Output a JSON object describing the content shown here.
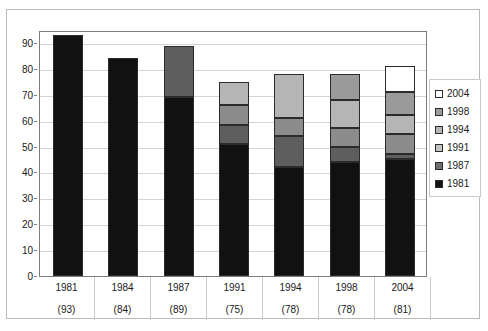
{
  "chart_data": {
    "type": "bar",
    "subtype": "stacked-bar",
    "title": "",
    "xlabel": "",
    "ylabel": "",
    "ylim": [
      0,
      95
    ],
    "y_ticks": [
      0,
      10,
      20,
      30,
      40,
      50,
      60,
      70,
      80,
      90
    ],
    "grid": true,
    "legend_position": "right",
    "categories": [
      "1981",
      "1984",
      "1987",
      "1991",
      "1994",
      "1998",
      "2004"
    ],
    "category_counts": [
      "(93)",
      "(84)",
      "(89)",
      "(75)",
      "(78)",
      "(78)",
      "(81)"
    ],
    "series": [
      {
        "name": "1981",
        "color": "#111111",
        "values": [
          93,
          84,
          69,
          51,
          42,
          44,
          45
        ]
      },
      {
        "name": "1987",
        "color": "#5e5e5e",
        "values": [
          0,
          0,
          20,
          7.5,
          12,
          6,
          2
        ]
      },
      {
        "name": "1991",
        "color": "#8c8c8c",
        "values": [
          0,
          0,
          0,
          7.5,
          7,
          7,
          8
        ]
      },
      {
        "name": "1994",
        "color": "#b5b5b5",
        "values": [
          0,
          0,
          0,
          9,
          17,
          11,
          7
        ]
      },
      {
        "name": "1998",
        "color": "#9a9a9a",
        "values": [
          0,
          0,
          0,
          0,
          0,
          10,
          9
        ]
      },
      {
        "name": "2004",
        "color": "#ffffff",
        "values": [
          0,
          0,
          0,
          0,
          0,
          0,
          10
        ]
      }
    ],
    "stack_totals": [
      93,
      84,
      89,
      75,
      78,
      78,
      81
    ],
    "legend_entries": [
      {
        "label": "2004",
        "color": "#ffffff"
      },
      {
        "label": "1998",
        "color": "#9a9a9a"
      },
      {
        "label": "1994",
        "color": "#b5b5b5"
      },
      {
        "label": "1991",
        "color": "#c4c4c4"
      },
      {
        "label": "1987",
        "color": "#6e6e6e"
      },
      {
        "label": "1981",
        "color": "#111111"
      }
    ]
  },
  "axis": {
    "y_tick_labels": [
      "90",
      "80",
      "70",
      "60",
      "50",
      "40",
      "30",
      "20",
      "10",
      "0"
    ]
  },
  "colors": {
    "plot_border": "#7d7d7d",
    "card_border": "#b9b9b9",
    "gridline": "#d4d4d4",
    "bar_border": "#2b2b2b"
  }
}
